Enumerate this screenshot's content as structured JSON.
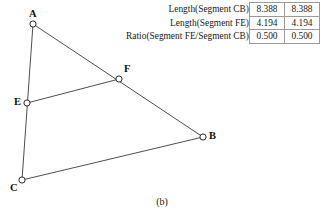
{
  "caption": "(b)",
  "table": {
    "rows": [
      {
        "label": "Length(Segment CB)",
        "value1": "8.388",
        "value2": "8.388"
      },
      {
        "label": "Length(Segment FE)",
        "value1": "4.194",
        "value2": "4.194"
      },
      {
        "label": "Ratio(Segment FE/Segment CB)",
        "value1": "0.500",
        "value2": "0.500"
      }
    ]
  },
  "figure": {
    "points": [
      {
        "name": "A",
        "label": "A",
        "x": 33,
        "y": 24,
        "label_dx": -4,
        "label_dy": -15
      },
      {
        "name": "B",
        "label": "B",
        "x": 203,
        "y": 137,
        "label_dx": 6,
        "label_dy": -6
      },
      {
        "name": "C",
        "label": "C",
        "x": 22,
        "y": 180,
        "label_dx": -12,
        "label_dy": 3
      },
      {
        "name": "E",
        "label": "E",
        "x": 27,
        "y": 103,
        "label_dx": -13,
        "label_dy": -6
      },
      {
        "name": "F",
        "label": "F",
        "x": 119,
        "y": 79,
        "label_dx": 5,
        "label_dy": -15
      }
    ],
    "segments": [
      {
        "name": "segment-AB",
        "from": "A",
        "to": "B"
      },
      {
        "name": "segment-AC",
        "from": "A",
        "to": "C"
      },
      {
        "name": "segment-CB",
        "from": "C",
        "to": "B"
      },
      {
        "name": "segment-EF",
        "from": "E",
        "to": "F"
      }
    ],
    "style": {
      "line_color": "#3a3a3a",
      "line_width": 0.9,
      "point_fill": "#ffffff",
      "point_stroke": "#2a2a2a",
      "point_radius": 3.1
    }
  }
}
